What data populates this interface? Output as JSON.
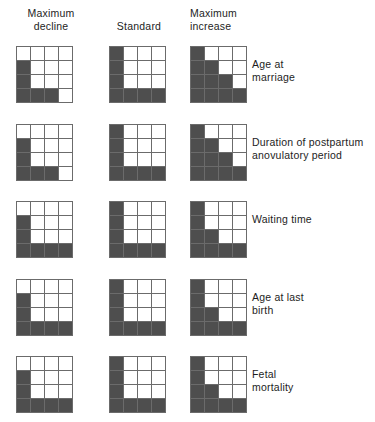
{
  "figure": {
    "columns": [
      {
        "key": "max_decline",
        "label": "Maximum\ndecline"
      },
      {
        "key": "standard",
        "label": "Standard"
      },
      {
        "key": "max_increase",
        "label": "Maximum\nincrease"
      }
    ],
    "colors": {
      "filled_cell": "#4e4e4e",
      "empty_cell": "#ffffff",
      "grid_line": "#6b6b6b",
      "background": "#ffffff",
      "text": "#1d1d1d"
    },
    "grid_size": {
      "rows": 4,
      "cols": 4
    },
    "rows": [
      {
        "label": "Age at\nmarriage",
        "grids": {
          "max_decline": [
            [
              0,
              0,
              0,
              0
            ],
            [
              1,
              0,
              0,
              0
            ],
            [
              1,
              0,
              0,
              0
            ],
            [
              1,
              1,
              1,
              0
            ]
          ],
          "standard": [
            [
              1,
              0,
              0,
              0
            ],
            [
              1,
              0,
              0,
              0
            ],
            [
              1,
              0,
              0,
              0
            ],
            [
              1,
              1,
              1,
              1
            ]
          ],
          "max_increase": [
            [
              1,
              0,
              0,
              0
            ],
            [
              1,
              1,
              0,
              0
            ],
            [
              1,
              1,
              1,
              0
            ],
            [
              1,
              1,
              1,
              1
            ]
          ]
        }
      },
      {
        "label": "Duration of postpartum\nanovulatory period",
        "grids": {
          "max_decline": [
            [
              0,
              0,
              0,
              0
            ],
            [
              1,
              0,
              0,
              0
            ],
            [
              1,
              0,
              0,
              0
            ],
            [
              1,
              1,
              1,
              0
            ]
          ],
          "standard": [
            [
              1,
              0,
              0,
              0
            ],
            [
              1,
              0,
              0,
              0
            ],
            [
              1,
              0,
              0,
              0
            ],
            [
              1,
              1,
              1,
              1
            ]
          ],
          "max_increase": [
            [
              1,
              0,
              0,
              0
            ],
            [
              1,
              1,
              0,
              0
            ],
            [
              1,
              1,
              1,
              0
            ],
            [
              1,
              1,
              1,
              1
            ]
          ]
        }
      },
      {
        "label": "Waiting time",
        "grids": {
          "max_decline": [
            [
              0,
              0,
              0,
              0
            ],
            [
              1,
              0,
              0,
              0
            ],
            [
              1,
              0,
              0,
              0
            ],
            [
              1,
              1,
              1,
              1
            ]
          ],
          "standard": [
            [
              1,
              0,
              0,
              0
            ],
            [
              1,
              0,
              0,
              0
            ],
            [
              1,
              0,
              0,
              0
            ],
            [
              1,
              1,
              1,
              1
            ]
          ],
          "max_increase": [
            [
              1,
              0,
              0,
              0
            ],
            [
              1,
              0,
              0,
              0
            ],
            [
              1,
              1,
              0,
              0
            ],
            [
              1,
              1,
              1,
              1
            ]
          ]
        }
      },
      {
        "label": "Age at last\nbirth",
        "grids": {
          "max_decline": [
            [
              0,
              0,
              0,
              0
            ],
            [
              1,
              0,
              0,
              0
            ],
            [
              1,
              0,
              0,
              0
            ],
            [
              1,
              1,
              1,
              1
            ]
          ],
          "standard": [
            [
              1,
              0,
              0,
              0
            ],
            [
              1,
              0,
              0,
              0
            ],
            [
              1,
              0,
              0,
              0
            ],
            [
              1,
              1,
              1,
              1
            ]
          ],
          "max_increase": [
            [
              1,
              0,
              0,
              0
            ],
            [
              1,
              0,
              0,
              0
            ],
            [
              1,
              1,
              0,
              0
            ],
            [
              1,
              1,
              1,
              1
            ]
          ]
        }
      },
      {
        "label": "Fetal\nmortality",
        "grids": {
          "max_decline": [
            [
              0,
              0,
              0,
              0
            ],
            [
              1,
              0,
              0,
              0
            ],
            [
              1,
              0,
              0,
              0
            ],
            [
              1,
              1,
              1,
              1
            ]
          ],
          "standard": [
            [
              1,
              0,
              0,
              0
            ],
            [
              1,
              0,
              0,
              0
            ],
            [
              1,
              0,
              0,
              0
            ],
            [
              1,
              1,
              1,
              1
            ]
          ],
          "max_increase": [
            [
              1,
              0,
              0,
              0
            ],
            [
              1,
              0,
              0,
              0
            ],
            [
              1,
              1,
              0,
              0
            ],
            [
              1,
              1,
              1,
              1
            ]
          ]
        }
      }
    ],
    "layout": {
      "column_x": [
        16,
        109,
        190
      ],
      "row_y": [
        46,
        124,
        201,
        279,
        356
      ],
      "grid_px": 57,
      "label_x": 252
    }
  }
}
